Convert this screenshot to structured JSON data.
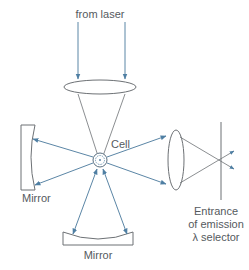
{
  "labels": {
    "from_laser": "from laser",
    "cell": "Cell",
    "mirror_left": "Mirror",
    "mirror_bottom": "Mirror",
    "entrance_line1": "Entrance",
    "entrance_line2": "of emission",
    "entrance_line3": "λ selector"
  },
  "colors": {
    "beam": "#5b86a6",
    "outline": "#6d7175",
    "text": "#555a5e"
  }
}
